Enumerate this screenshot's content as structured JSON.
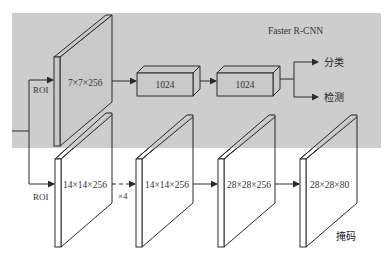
{
  "colors": {
    "panel_bg": "#c9c9c9",
    "line": "#2a2a2a",
    "map_fill": "#ffffff",
    "page_bg": "#ffffff"
  },
  "panel": {
    "title": "Faster R-CNN"
  },
  "roi_top": {
    "label": "ROI"
  },
  "roi_bottom": {
    "label": "ROI"
  },
  "top_branch": {
    "feature_map": {
      "label": "7×7×256"
    },
    "fc1": {
      "label": "1024"
    },
    "fc2": {
      "label": "1024"
    },
    "outputs": [
      {
        "label": "分类"
      },
      {
        "label": "检测"
      }
    ]
  },
  "mask_branch": {
    "maps": [
      {
        "label": "14×14×256"
      },
      {
        "label": "14×14×256"
      },
      {
        "label": "28×28×256"
      },
      {
        "label": "28×28×80"
      }
    ],
    "repeat_label": "×4",
    "output_label": "掩码"
  }
}
